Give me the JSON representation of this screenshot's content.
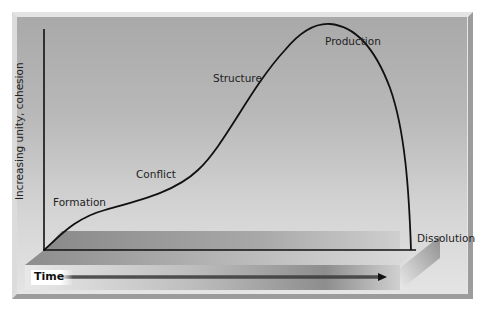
{
  "diagram": {
    "title": "",
    "y_axis_label": "Increasing unity, cohesion",
    "x_axis_label": "Time",
    "stages": [
      {
        "label": "Formation"
      },
      {
        "label": "Conflict"
      },
      {
        "label": "Structure"
      },
      {
        "label": "Production"
      },
      {
        "label": "Dissolution"
      }
    ],
    "colors": {
      "curve": "#111111",
      "background_top": "#a9a9a9",
      "background_bottom": "#e4e4e4",
      "platform_dark": "#7f7f7f"
    }
  }
}
